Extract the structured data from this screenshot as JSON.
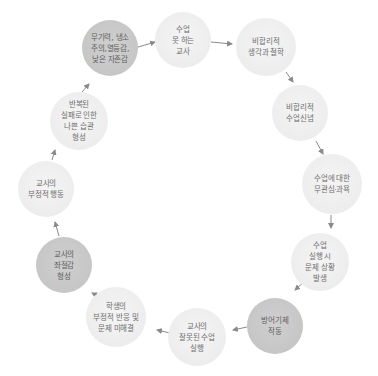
{
  "diagram": {
    "type": "cycle",
    "colors": {
      "light_node": "#eeeeee",
      "dark_node": "#c6c6c6",
      "text": "#6e6e6e",
      "arrow": "#8a8a8a"
    },
    "nodes": [
      {
        "id": 1,
        "lines": [
          "수업",
          "못 하는",
          "교사"
        ],
        "shade": "light"
      },
      {
        "id": 2,
        "lines": [
          "비합리적",
          "생각과 철학"
        ],
        "shade": "light"
      },
      {
        "id": 3,
        "lines": [
          "비합리적",
          "수업신념"
        ],
        "shade": "light"
      },
      {
        "id": 4,
        "lines": [
          "수업에 대한",
          "무관심·과욕"
        ],
        "shade": "light"
      },
      {
        "id": 5,
        "lines": [
          "수업",
          "실행 시",
          "문제 상황",
          "발생"
        ],
        "shade": "light"
      },
      {
        "id": 6,
        "lines": [
          "방어기제",
          "작동"
        ],
        "shade": "dark"
      },
      {
        "id": 7,
        "lines": [
          "교사의",
          "잘못된 수업",
          "실행"
        ],
        "shade": "light"
      },
      {
        "id": 8,
        "lines": [
          "학생의",
          "부정적 반응 및",
          "문제 미해결"
        ],
        "shade": "light"
      },
      {
        "id": 9,
        "lines": [
          "교사의",
          "좌절감",
          "형성"
        ],
        "shade": "dark"
      },
      {
        "id": 10,
        "lines": [
          "교사의",
          "부정적 행동"
        ],
        "shade": "light"
      },
      {
        "id": 11,
        "lines": [
          "반복된",
          "실패로 인한",
          "나쁜 습관",
          "형성"
        ],
        "shade": "light"
      },
      {
        "id": 12,
        "lines": [
          "무기력, 냉소",
          "주의,열등감,",
          "낮은 자존감"
        ],
        "shade": "dark"
      }
    ],
    "flow": "clockwise: 1→2→3→4→5→6→7→8→9→10→11→12→1"
  }
}
